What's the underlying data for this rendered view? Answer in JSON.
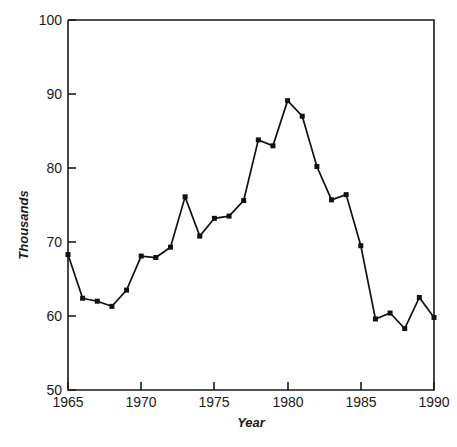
{
  "chart_data": {
    "type": "line",
    "title": "",
    "subtitle": "",
    "xlabel": "Year",
    "ylabel": "Thousands",
    "xlim": [
      1965,
      1990
    ],
    "ylim": [
      50,
      100
    ],
    "xticks": [
      1965,
      1970,
      1975,
      1980,
      1985,
      1990
    ],
    "xtick_labels": [
      "1965",
      "1970",
      "1975",
      "1980",
      "1985",
      "1990"
    ],
    "yticks": [
      50,
      60,
      70,
      80,
      90,
      100
    ],
    "ytick_labels": [
      "50",
      "60",
      "70",
      "80",
      "90",
      "100"
    ],
    "grid": false,
    "legend": false,
    "legend_position": "none",
    "marker": "square",
    "line_color": "#111111",
    "marker_color": "#111111",
    "axis_color": "#1a1a1a",
    "background_color": "#ffffff",
    "x": [
      1965,
      1966,
      1967,
      1968,
      1969,
      1970,
      1971,
      1972,
      1973,
      1974,
      1975,
      1976,
      1977,
      1978,
      1979,
      1980,
      1981,
      1982,
      1983,
      1984,
      1985,
      1986,
      1987,
      1988,
      1989,
      1990
    ],
    "values": [
      68.3,
      62.4,
      62.0,
      61.3,
      63.5,
      68.1,
      67.9,
      69.3,
      76.1,
      70.8,
      73.2,
      73.5,
      75.6,
      83.8,
      83.0,
      89.1,
      87.0,
      80.2,
      75.7,
      76.4,
      69.5,
      59.6,
      60.4,
      58.3,
      62.5,
      59.8
    ],
    "series": [
      {
        "name": "Thousands",
        "values": [
          68.3,
          62.4,
          62.0,
          61.3,
          63.5,
          68.1,
          67.9,
          69.3,
          76.1,
          70.8,
          73.2,
          73.5,
          75.6,
          83.8,
          83.0,
          89.1,
          87.0,
          80.2,
          75.7,
          76.4,
          69.5,
          59.6,
          60.4,
          58.3,
          62.5,
          59.8
        ]
      }
    ],
    "annotations": []
  },
  "caption": {
    "text": ""
  }
}
